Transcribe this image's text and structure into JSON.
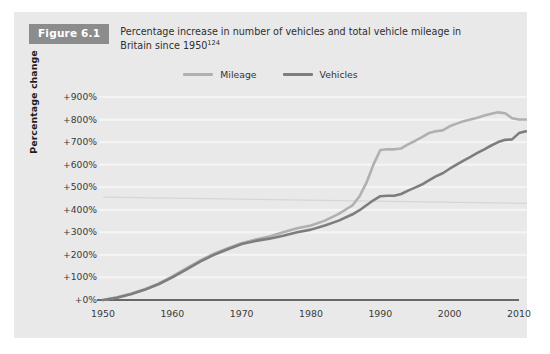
{
  "figure": {
    "badge": "Figure 6.1",
    "caption_line1": "Percentage increase in number of vehicles and total vehicle mileage in",
    "caption_line2": "Britain since 1950",
    "caption_reference": "124"
  },
  "colors": {
    "card_background": "#e9e9e9",
    "page_background": "#ffffff",
    "badge_background": "#8c8c8c",
    "badge_text": "#ffffff",
    "mileage_line": "#b0b0b0",
    "vehicles_line": "#7d7d7d",
    "gridline": "#f4f4f4",
    "axis_line": "#3c3c3c",
    "tick_text": "#3a3a3a"
  },
  "chart_data": {
    "type": "line",
    "title": "Percentage increase in number of vehicles and total vehicle mileage in Britain since 1950",
    "xlabel": "",
    "ylabel": "Percentage change",
    "xlim": [
      1950,
      2012
    ],
    "ylim": [
      0,
      900
    ],
    "grid": true,
    "legend_position": "top-center",
    "x_ticks": [
      1950,
      1960,
      1970,
      1980,
      1990,
      2000,
      2010
    ],
    "x_tick_labels": [
      "1950",
      "1960",
      "1970",
      "1980",
      "1990",
      "2000",
      "2010"
    ],
    "y_ticks": [
      0,
      100,
      200,
      300,
      400,
      500,
      600,
      700,
      800,
      900
    ],
    "y_tick_labels": [
      "+0%",
      "+100%",
      "+200%",
      "+300%",
      "+400%",
      "+500%",
      "+600%",
      "+700%",
      "+800%",
      "+900%"
    ],
    "series": [
      {
        "name": "Mileage",
        "color": "#b0b0b0",
        "x": [
          1950,
          1952,
          1954,
          1956,
          1958,
          1960,
          1962,
          1964,
          1966,
          1968,
          1970,
          1972,
          1974,
          1976,
          1978,
          1980,
          1982,
          1984,
          1986,
          1987,
          1988,
          1989,
          1990,
          1991,
          1992,
          1993,
          1994,
          1995,
          1996,
          1997,
          1998,
          1999,
          2000,
          2001,
          2002,
          2003,
          2004,
          2005,
          2006,
          2007,
          2008,
          2009,
          2010,
          2011
        ],
        "values": [
          0,
          12,
          28,
          48,
          72,
          105,
          140,
          175,
          205,
          230,
          252,
          268,
          282,
          300,
          318,
          330,
          352,
          382,
          420,
          460,
          520,
          600,
          665,
          668,
          668,
          672,
          690,
          705,
          722,
          740,
          748,
          752,
          770,
          782,
          792,
          800,
          808,
          818,
          826,
          832,
          828,
          806,
          800,
          800
        ]
      },
      {
        "name": "Vehicles",
        "color": "#7d7d7d",
        "x": [
          1950,
          1952,
          1954,
          1956,
          1958,
          1960,
          1962,
          1964,
          1966,
          1968,
          1970,
          1972,
          1974,
          1976,
          1978,
          1980,
          1982,
          1984,
          1986,
          1987,
          1988,
          1989,
          1990,
          1991,
          1992,
          1993,
          1994,
          1995,
          1996,
          1997,
          1998,
          1999,
          2000,
          2001,
          2002,
          2003,
          2004,
          2005,
          2006,
          2007,
          2008,
          2009,
          2010,
          2011
        ],
        "values": [
          0,
          10,
          25,
          45,
          70,
          100,
          135,
          170,
          200,
          225,
          248,
          262,
          272,
          285,
          300,
          312,
          330,
          352,
          380,
          398,
          420,
          442,
          460,
          462,
          462,
          470,
          485,
          498,
          512,
          530,
          548,
          562,
          582,
          600,
          618,
          635,
          652,
          668,
          685,
          700,
          710,
          712,
          740,
          748
        ]
      }
    ],
    "annotations": [
      {
        "name": "faint-trend-artifact",
        "x": [
          1950,
          2012
        ],
        "values": [
          456,
          428
        ],
        "color": "#d6d6d6"
      }
    ]
  },
  "legend": {
    "items": [
      {
        "label": "Mileage",
        "color": "#b0b0b0"
      },
      {
        "label": "Vehicles",
        "color": "#7d7d7d"
      }
    ]
  }
}
